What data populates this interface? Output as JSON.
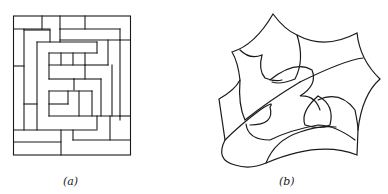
{
  "figures": [
    {
      "id": "a",
      "caption": "(a)",
      "description": "rectangular maze-like tiling of nested rectangles"
    },
    {
      "id": "b",
      "caption": "(b)",
      "description": "curvilinear star-shaped region subdivided by arcs"
    }
  ],
  "colors": {
    "stroke": "#1a1a1a",
    "background": "#ffffff"
  }
}
